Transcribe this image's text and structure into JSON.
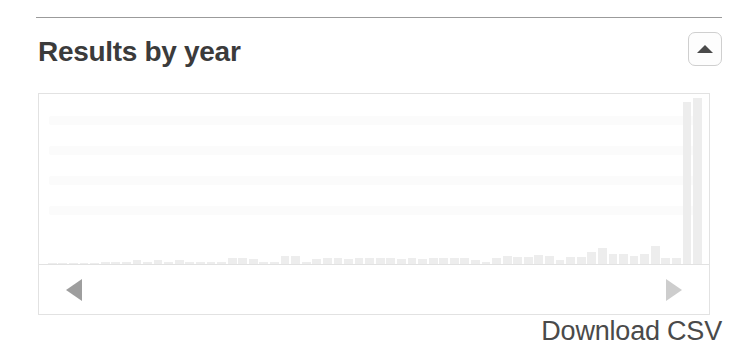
{
  "panel": {
    "title": "Results by year",
    "collapse_button_label": "",
    "collapse_icon": "caret-up-icon"
  },
  "pager": {
    "prev_icon": "caret-left-icon",
    "next_icon": "caret-right-icon",
    "prev_label": "",
    "next_label": ""
  },
  "actions": {
    "download_csv_label": "Download CSV"
  },
  "colors": {
    "bar": "#ededed",
    "title_text": "#3b3b3b",
    "link_text": "#4a4a4a",
    "frame_border": "#e2e2e2",
    "rule": "#9b9b9b",
    "arrow_prev": "#9e9e9e",
    "arrow_next": "#cdcdcd"
  },
  "chart_data": {
    "type": "bar",
    "title": "Results by year",
    "xlabel": "",
    "ylabel": "",
    "grid": false,
    "legend": null,
    "ylim": [
      0,
      1000
    ],
    "categories": [
      "1964",
      "1965",
      "1966",
      "1967",
      "1968",
      "1969",
      "1970",
      "1971",
      "1972",
      "1973",
      "1974",
      "1975",
      "1976",
      "1977",
      "1978",
      "1979",
      "1980",
      "1981",
      "1982",
      "1983",
      "1984",
      "1985",
      "1986",
      "1987",
      "1988",
      "1989",
      "1990",
      "1991",
      "1992",
      "1993",
      "1994",
      "1995",
      "1996",
      "1997",
      "1998",
      "1999",
      "2000",
      "2001",
      "2002",
      "2003",
      "2004",
      "2005",
      "2006",
      "2007",
      "2008",
      "2009",
      "2010",
      "2011",
      "2012",
      "2013",
      "2014",
      "2015",
      "2016",
      "2017",
      "2018",
      "2019",
      "2020",
      "2021",
      "2022",
      "2023",
      "2024",
      "2025"
    ],
    "values": [
      8,
      2,
      1,
      1,
      1,
      10,
      9,
      12,
      22,
      10,
      24,
      12,
      26,
      9,
      14,
      13,
      12,
      36,
      34,
      31,
      13,
      10,
      46,
      47,
      10,
      30,
      33,
      34,
      30,
      36,
      35,
      36,
      38,
      30,
      34,
      32,
      35,
      36,
      38,
      34,
      21,
      14,
      38,
      46,
      40,
      42,
      52,
      48,
      26,
      40,
      44,
      72,
      96,
      62,
      60,
      46,
      60,
      106,
      36,
      38,
      960,
      985
    ]
  }
}
